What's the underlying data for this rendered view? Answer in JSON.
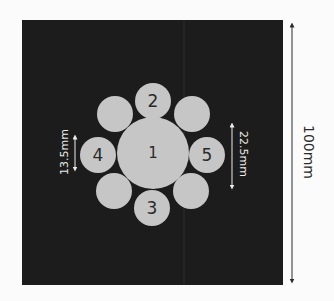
{
  "diagram": {
    "colors": {
      "background": "#fbfbfb",
      "plate": "#1c1c1c",
      "rod": "#c6c6c6",
      "rod_label": "#2a2a2a",
      "dimension_light": "#ececec",
      "dimension_dark": "#2a2a2a"
    },
    "rods": [
      {
        "id": "rod-1",
        "label": "1",
        "cx": 153,
        "cy": 153,
        "r": 36
      },
      {
        "id": "rod-2",
        "label": "2",
        "cx": 153,
        "cy": 101,
        "r": 18
      },
      {
        "id": "rod-3",
        "label": "3",
        "cx": 152,
        "cy": 208,
        "r": 18
      },
      {
        "id": "rod-4",
        "label": "4",
        "cx": 98,
        "cy": 155,
        "r": 18
      },
      {
        "id": "rod-5",
        "label": "5",
        "cx": 207,
        "cy": 155,
        "r": 18
      },
      {
        "id": "rod-ne",
        "label": "",
        "cx": 192,
        "cy": 114,
        "r": 18
      },
      {
        "id": "rod-nw",
        "label": "",
        "cx": 115,
        "cy": 114,
        "r": 18
      },
      {
        "id": "rod-se",
        "label": "",
        "cx": 191,
        "cy": 191,
        "r": 18
      },
      {
        "id": "rod-sw",
        "label": "",
        "cx": 114,
        "cy": 191,
        "r": 18
      }
    ],
    "dimensions": {
      "plate_size": "100mm",
      "small_rod_diameter": "13.5mm",
      "large_rod_diameter": "22.5mm"
    }
  }
}
